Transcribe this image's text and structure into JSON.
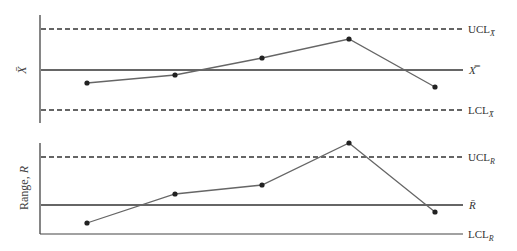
{
  "chart_data": [
    {
      "type": "line",
      "title": "X-bar control chart",
      "ylabel": "X̄",
      "xlabel": "",
      "x": [
        1,
        2,
        3,
        4,
        5
      ],
      "series": [
        {
          "name": "Sample mean",
          "values": [
            -0.32,
            -0.12,
            0.3,
            0.77,
            -0.42
          ]
        }
      ],
      "reference_lines": [
        {
          "name": "UCL_X̄",
          "label": "UCL",
          "subscript": "X̄",
          "value": 1.0,
          "style": "dashed"
        },
        {
          "name": "X̿",
          "label": "X̿",
          "subscript": "",
          "value": 0.0,
          "style": "solid"
        },
        {
          "name": "LCL_X̄",
          "label": "LCL",
          "subscript": "X̄",
          "value": -1.0,
          "style": "dashed"
        }
      ],
      "ylim": [
        -1.3,
        1.35
      ],
      "grid": false,
      "legend": "none (labels at right end of reference lines)"
    },
    {
      "type": "line",
      "title": "Range control chart",
      "ylabel": "Range, R",
      "xlabel": "",
      "x": [
        1,
        2,
        3,
        4,
        5
      ],
      "series": [
        {
          "name": "Sample range",
          "values": [
            -0.38,
            0.23,
            0.42,
            1.3,
            -0.15
          ]
        }
      ],
      "reference_lines": [
        {
          "name": "UCL_R",
          "label": "UCL",
          "subscript": "R",
          "value": 1.0,
          "style": "dashed"
        },
        {
          "name": "R̄",
          "label": "R̄",
          "subscript": "",
          "value": 0.0,
          "style": "solid"
        },
        {
          "name": "LCL_R",
          "label": "LCL",
          "subscript": "R",
          "value": -0.6,
          "style": "solid"
        }
      ],
      "ylim": [
        -0.6,
        1.3
      ],
      "grid": false,
      "legend": "none (labels at right end of reference lines)"
    }
  ],
  "top": {
    "ylabel": "X̄",
    "ucl_label": "UCL",
    "ucl_sub": "X̄",
    "center_label": "X̿",
    "lcl_label": "LCL",
    "lcl_sub": "X̄",
    "points": [
      [
        87,
        83
      ],
      [
        175,
        75
      ],
      [
        262,
        58
      ],
      [
        349,
        39
      ],
      [
        435,
        87
      ]
    ],
    "ucl_y": 29,
    "center_y": 70,
    "lcl_y": 110
  },
  "bottom": {
    "ylabel_main": "Range, ",
    "ylabel_var": "R",
    "ucl_label": "UCL",
    "ucl_sub": "R",
    "center_label": "R̄",
    "lcl_label": "LCL",
    "lcl_sub": "R",
    "points": [
      [
        87,
        223
      ],
      [
        175,
        194
      ],
      [
        262,
        185
      ],
      [
        349,
        143
      ],
      [
        435,
        212
      ]
    ],
    "ucl_y": 157,
    "center_y": 205,
    "lcl_y": 234
  },
  "colors": {
    "axis": "#444444",
    "line": "#666666",
    "point": "#222222",
    "label": "#333333"
  }
}
